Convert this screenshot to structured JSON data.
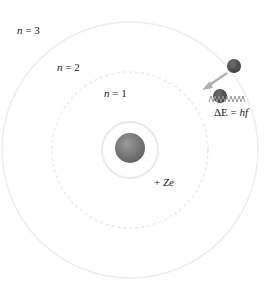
{
  "diagram": {
    "nucleus": {
      "label_sign": "+",
      "label_charge": "Ze",
      "color": "#7a7a7a"
    },
    "orbits": [
      {
        "n_symbol": "n",
        "eq": " = 1"
      },
      {
        "n_symbol": "n",
        "eq": " = 2"
      },
      {
        "n_symbol": "n",
        "eq": " = 3"
      }
    ],
    "transition": {
      "energy_prefix": "ΔE = ",
      "energy_expr": "hf",
      "arrow_color": "#b0b0b0",
      "electron_color": "#555555",
      "photon_color": "#9a9a9a"
    }
  }
}
